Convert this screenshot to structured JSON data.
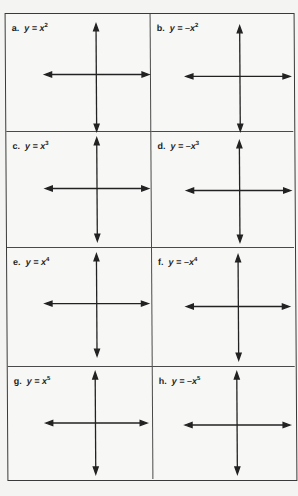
{
  "worksheet": {
    "cells": [
      {
        "letter": "a.",
        "lhs": "y = ",
        "sign": "",
        "base": "x",
        "exponent": "2"
      },
      {
        "letter": "b.",
        "lhs": "y = ",
        "sign": "–",
        "base": "x",
        "exponent": "2"
      },
      {
        "letter": "c.",
        "lhs": "y = ",
        "sign": "",
        "base": "x",
        "exponent": "3"
      },
      {
        "letter": "d.",
        "lhs": "y = ",
        "sign": "–",
        "base": "x",
        "exponent": "3"
      },
      {
        "letter": "e.",
        "lhs": "y = ",
        "sign": "",
        "base": "x",
        "exponent": "4"
      },
      {
        "letter": "f.",
        "lhs": "y = ",
        "sign": "–",
        "base": "x",
        "exponent": "4"
      },
      {
        "letter": "g.",
        "lhs": "y = ",
        "sign": "",
        "base": "x",
        "exponent": "5"
      },
      {
        "letter": "h.",
        "lhs": "y = ",
        "sign": "–",
        "base": "x",
        "exponent": "5"
      }
    ]
  },
  "colors": {
    "ink": "#222222",
    "border": "#3a3a3a",
    "paper": "#f7f7f5"
  }
}
